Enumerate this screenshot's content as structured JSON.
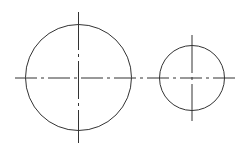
{
  "diagram": {
    "type": "technical-drawing",
    "stroke_color": "#333333",
    "background": "#ffffff",
    "circles": [
      {
        "id": "large-circle",
        "cx": 78.5,
        "cy": 77.5,
        "r": 53
      },
      {
        "id": "small-circle",
        "cx": 192,
        "cy": 78,
        "r": 32.5
      }
    ],
    "centerlines": {
      "horizontal": {
        "x1": 15,
        "y1": 78,
        "x2": 236,
        "y2": 78,
        "dash": "22 4 3 4"
      },
      "vertical": [
        {
          "x1": 78.5,
          "y1": 12,
          "x2": 78.5,
          "y2": 143,
          "dash": "38 4 3 4"
        },
        {
          "x1": 192,
          "y1": 35,
          "x2": 192,
          "y2": 121,
          "dash": "38 4 3 4"
        }
      ]
    }
  }
}
